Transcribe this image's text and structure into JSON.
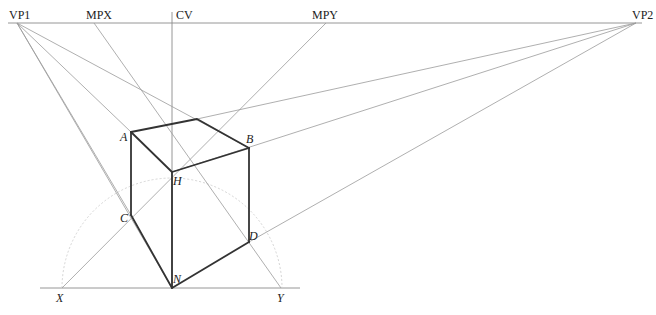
{
  "diagram": {
    "horizon": {
      "y": 23,
      "x1": 8,
      "x2": 642,
      "labels": {
        "vp1": "VP1",
        "mpx": "MPX",
        "cv": "CV",
        "mpy": "MPY",
        "vp2": "VP2"
      }
    },
    "points": {
      "VP1": [
        17,
        23
      ],
      "MPX": [
        94,
        23
      ],
      "CV": [
        172,
        23
      ],
      "MPY": [
        326,
        23
      ],
      "VP2": [
        636,
        23
      ],
      "A": [
        131,
        132
      ],
      "T": [
        197,
        119
      ],
      "B": [
        249,
        148
      ],
      "H": [
        172,
        172
      ],
      "C": [
        131,
        215
      ],
      "N": [
        172,
        288
      ],
      "D": [
        249,
        242
      ],
      "X": [
        62,
        288
      ],
      "Y": [
        281,
        288
      ]
    },
    "point_labels": {
      "A": "A",
      "B": "B",
      "H": "H",
      "C": "C",
      "D": "D",
      "N": "N",
      "X": "X",
      "Y": "Y"
    },
    "ground_line": {
      "y": 288,
      "x1": 40,
      "x2": 300
    },
    "arc": {
      "cx": 172,
      "cy": 288,
      "r": 110
    },
    "colors": {
      "construction": "#9a9a9a",
      "edges": "#333333",
      "arc": "#cfcfcf",
      "text": "#222222"
    }
  }
}
